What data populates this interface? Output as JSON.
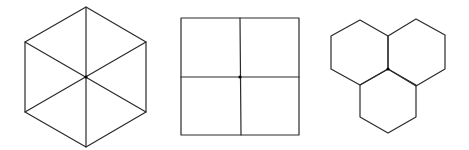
{
  "diagram": {
    "background": "#ffffff",
    "stroke_color": "#2a2a2a",
    "vertex_color": "#000000",
    "figures": [
      {
        "id": "hexagon-six-triangles",
        "description": "Regular hexagon divided into six triangles meeting at center",
        "outline": [
          [
            86,
            7
          ],
          [
            146,
            42
          ],
          [
            146,
            112
          ],
          [
            86,
            147
          ],
          [
            25,
            112
          ],
          [
            25,
            42
          ]
        ],
        "spokes": [
          [
            [
              86,
              7
            ],
            [
              86,
              147
            ]
          ],
          [
            [
              25,
              42
            ],
            [
              146,
              112
            ]
          ],
          [
            [
              146,
              42
            ],
            [
              25,
              112
            ]
          ]
        ],
        "center": [
          86,
          77
        ]
      },
      {
        "id": "square-four-quadrants",
        "description": "Square divided into four equal squares meeting at center",
        "outline": [
          [
            181,
            18
          ],
          [
            299,
            18
          ],
          [
            299,
            135
          ],
          [
            181,
            135
          ]
        ],
        "spokes": [
          [
            [
              240,
              18
            ],
            [
              241,
              135
            ]
          ],
          [
            [
              181,
              77
            ],
            [
              299,
              77
            ]
          ]
        ],
        "center": [
          240,
          77
        ]
      },
      {
        "id": "three-hexagons-vertex",
        "description": "Three regular hexagons meeting at a common vertex",
        "hexagons": [
          [
            [
              360,
              20
            ],
            [
              388,
              36
            ],
            [
              388,
              69
            ],
            [
              360,
              85
            ],
            [
              331,
              69
            ],
            [
              331,
              36
            ]
          ],
          [
            [
              416,
              19
            ],
            [
              445,
              35
            ],
            [
              445,
              69
            ],
            [
              416,
              86
            ],
            [
              388,
              69
            ],
            [
              388,
              36
            ]
          ],
          [
            [
              388,
              69
            ],
            [
              416,
              85
            ],
            [
              416,
              117
            ],
            [
              388,
              133
            ],
            [
              360,
              117
            ],
            [
              360,
              85
            ]
          ]
        ],
        "center": [
          388,
          69
        ]
      }
    ]
  }
}
